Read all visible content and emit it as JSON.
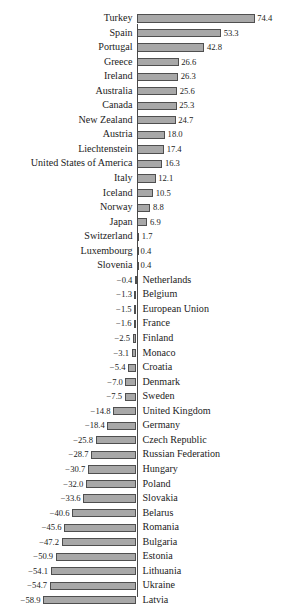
{
  "figure": {
    "title_remnant": "",
    "bar_fill": "#a8a8a8",
    "bar_stroke": "#4f4f4f",
    "axis_color": "#4a4a4a"
  },
  "chart_data": {
    "type": "bar",
    "orientation": "horizontal",
    "title": "",
    "xlabel": "",
    "ylabel": "",
    "grid": false,
    "legend": null,
    "zero_axis": 0,
    "xlim": [
      -58.9,
      74.4
    ],
    "sorted": "descending",
    "value_format": "one decimal place",
    "categories": [
      "Turkey",
      "Spain",
      "Portugal",
      "Greece",
      "Ireland",
      "Australia",
      "Canada",
      "New Zealand",
      "Austria",
      "Liechtenstein",
      "United States of America",
      "Italy",
      "Iceland",
      "Norway",
      "Japan",
      "Switzerland",
      "Luxembourg",
      "Slovenia",
      "Netherlands",
      "Belgium",
      "European Union",
      "France",
      "Finland",
      "Monaco",
      "Croatia",
      "Denmark",
      "Sweden",
      "United Kingdom",
      "Germany",
      "Czech Republic",
      "Russian Federation",
      "Hungary",
      "Poland",
      "Slovakia",
      "Belarus",
      "Romania",
      "Bulgaria",
      "Estonia",
      "Lithuania",
      "Ukraine",
      "Latvia"
    ],
    "values": [
      74.4,
      53.3,
      42.8,
      26.6,
      26.3,
      25.6,
      25.3,
      24.7,
      18.0,
      17.4,
      16.3,
      12.1,
      10.5,
      8.8,
      6.9,
      1.7,
      0.4,
      0.4,
      -0.4,
      -1.3,
      -1.5,
      -1.6,
      -2.5,
      -3.1,
      -5.4,
      -7.0,
      -7.5,
      -14.8,
      -18.4,
      -25.8,
      -28.7,
      -30.7,
      -32.0,
      -33.6,
      -40.6,
      -45.6,
      -47.2,
      -50.9,
      -54.1,
      -54.7,
      -58.9
    ],
    "labels": [
      "74.4",
      "53.3",
      "42.8",
      "26.6",
      "26.3",
      "25.6",
      "25.3",
      "24.7",
      "18.0",
      "17.4",
      "16.3",
      "12.1",
      "10.5",
      "8.8",
      "6.9",
      "1.7",
      "0.4",
      "0.4",
      "−0.4",
      "−1.3",
      "−1.5",
      "−1.6",
      "−2.5",
      "−3.1",
      "−5.4",
      "−7.0",
      "−7.5",
      "−14.8",
      "−18.4",
      "−25.8",
      "−28.7",
      "−30.7",
      "−32.0",
      "−33.6",
      "−40.6",
      "−45.6",
      "−47.2",
      "−50.9",
      "−54.1",
      "−54.7",
      "−58.9"
    ]
  }
}
